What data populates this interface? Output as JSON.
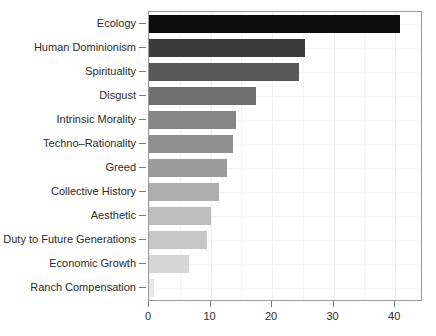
{
  "chart_data": {
    "type": "bar",
    "orientation": "horizontal",
    "title": "",
    "subtitle": "",
    "xlabel": "",
    "ylabel": "",
    "categories": [
      "Ecology",
      "Human Dominionism",
      "Spirituality",
      "Disgust",
      "Intrinsic Morality",
      "Techno–Rationality",
      "Greed",
      "Collective History",
      "Aesthetic",
      "Duty to Future Generations",
      "Economic Growth",
      "Ranch Compensation"
    ],
    "values": [
      40.8,
      25.3,
      24.4,
      17.4,
      14.2,
      13.7,
      12.7,
      11.3,
      10.0,
      9.4,
      6.5,
      0.8
    ],
    "bar_colors": [
      "#0d0d0d",
      "#3b3b3b",
      "#585858",
      "#6f6f6f",
      "#868686",
      "#8f8f8f",
      "#9b9b9b",
      "#aeaeae",
      "#bdbdbd",
      "#c6c6c6",
      "#d6d6d6",
      "#e7e7e7"
    ],
    "xlim": [
      0,
      44.2
    ],
    "xticks": [
      0,
      10,
      20,
      30,
      40
    ],
    "xtick_labels": [
      "0",
      "10",
      "20",
      "30",
      "40"
    ],
    "xticks_minor": [
      5,
      15,
      25,
      35
    ],
    "grid": true,
    "legend": "none",
    "panel_border_color": "#9a9a9a",
    "axis_text_color": "#2b2b2b",
    "background": "#ffffff"
  }
}
